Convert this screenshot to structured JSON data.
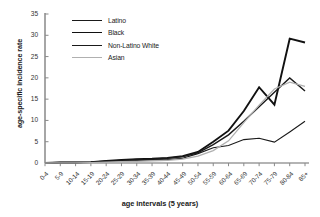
{
  "chart_data": {
    "type": "line",
    "title": "",
    "xlabel": "age intervals (5 years)",
    "ylabel": "age-specific incidence rate",
    "ylim": [
      0,
      35
    ],
    "yticks": [
      0,
      5,
      10,
      15,
      20,
      25,
      30,
      35
    ],
    "grid": false,
    "legend_position": "top-left",
    "categories": [
      "0-4",
      "5-9",
      "10-14",
      "15-19",
      "20-24",
      "25-29",
      "30-34",
      "35-39",
      "40-44",
      "45-49",
      "50-54",
      "55-59",
      "60-64",
      "65-69",
      "70-74",
      "75-79",
      "80-84",
      "85+"
    ],
    "series": [
      {
        "name": "Latino",
        "color": "#1a1a1a",
        "width": 1.1,
        "values": [
          0,
          0.1,
          0.1,
          0.15,
          0.4,
          0.5,
          0.6,
          0.7,
          0.8,
          1.1,
          2.2,
          3.6,
          4.1,
          5.5,
          5.8,
          4.9,
          7.3,
          9.8
        ]
      },
      {
        "name": "Black",
        "color": "#111111",
        "width": 1.9,
        "values": [
          0,
          0.1,
          0.1,
          0.2,
          0.5,
          0.7,
          0.9,
          1.0,
          1.2,
          1.6,
          2.6,
          5.0,
          7.6,
          12.2,
          17.8,
          13.7,
          29.2,
          28.3
        ]
      },
      {
        "name": "Non-Latino White",
        "color": "#1a1a1a",
        "width": 1.45,
        "values": [
          0,
          0.1,
          0.1,
          0.2,
          0.4,
          0.6,
          0.8,
          0.9,
          1.1,
          1.5,
          2.4,
          4.3,
          6.6,
          9.8,
          13.2,
          16.6,
          20.0,
          16.9
        ]
      },
      {
        "name": "Asian",
        "color": "#b0b0b0",
        "width": 1.3,
        "values": [
          0,
          0.05,
          0.05,
          0.1,
          0.2,
          0.3,
          0.4,
          0.5,
          0.6,
          0.9,
          1.6,
          2.9,
          5.2,
          9.5,
          13.6,
          17.4,
          19.0,
          18.0
        ]
      }
    ]
  },
  "axis": {
    "y_tick_labels": [
      "0",
      "5",
      "10",
      "15",
      "20",
      "25",
      "30",
      "35"
    ],
    "x_tick_labels": [
      "0-4",
      "5-9",
      "10-14",
      "15-19",
      "20-24",
      "25-29",
      "30-34",
      "35-39",
      "40-44",
      "45-49",
      "50-54",
      "55-59",
      "60-64",
      "65-69",
      "70-74",
      "75-79",
      "80-84",
      "85+"
    ]
  },
  "legend": {
    "items": [
      {
        "label": "Latino"
      },
      {
        "label": "Black"
      },
      {
        "label": "Non-Latino White"
      },
      {
        "label": "Asian"
      }
    ]
  }
}
